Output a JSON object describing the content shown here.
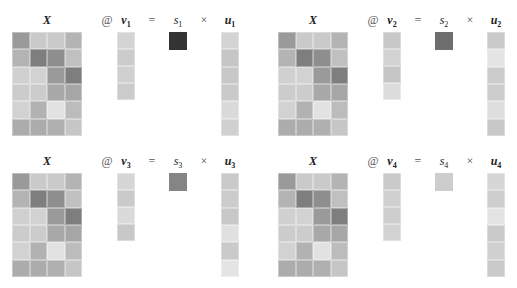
{
  "matrix_label": "X",
  "operators": {
    "matmul": "@",
    "equals": "=",
    "times": "×"
  },
  "x_matrix_colors": [
    [
      "#9a9a9a",
      "#cacaca",
      "#cacaca",
      "#b4b4b4"
    ],
    [
      "#b4b4b4",
      "#7e7e7e",
      "#8e8e8e",
      "#c0c0c0"
    ],
    [
      "#d0d0d0",
      "#d2d2d2",
      "#9a9a9a",
      "#7e7e7e"
    ],
    [
      "#cccccc",
      "#cccccc",
      "#a8a8a8",
      "#a6a6a6"
    ],
    [
      "#d2d2d2",
      "#b2b2b2",
      "#e2e2e2",
      "#bcbcbc"
    ],
    [
      "#acacac",
      "#acacac",
      "#b0b0b0",
      "#c6c6c6"
    ]
  ],
  "panels": [
    {
      "index": "1",
      "v_label": "v",
      "s_label": "s",
      "u_label": "u",
      "v_colors": [
        "#d4d4d4",
        "#cccccc",
        "#d0d0d0",
        "#cbcbcb"
      ],
      "s_color": "#333333",
      "u_colors": [
        "#d4d4d4",
        "#c6c6c6",
        "#c8c8c8",
        "#cacaca",
        "#dadada",
        "#d0d0d0"
      ]
    },
    {
      "index": "2",
      "v_label": "v",
      "s_label": "s",
      "u_label": "u",
      "v_colors": [
        "#c8c8c8",
        "#d2d2d2",
        "#c6c6c6",
        "#dcdcdc"
      ],
      "s_color": "#6e6e6e",
      "u_colors": [
        "#cacaca",
        "#e4e4e4",
        "#cccccc",
        "#cdcdcd",
        "#dedede",
        "#c8c8c8"
      ]
    },
    {
      "index": "3",
      "v_label": "v",
      "s_label": "s",
      "u_label": "u",
      "v_colors": [
        "#d6d6d6",
        "#cacaca",
        "#dadada",
        "#c8c8c8"
      ],
      "s_color": "#858585",
      "u_colors": [
        "#cacaca",
        "#cccccc",
        "#c8c8c8",
        "#e0e0e0",
        "#cacaca",
        "#e4e4e4"
      ]
    },
    {
      "index": "4",
      "v_label": "v",
      "s_label": "s",
      "u_label": "u",
      "v_colors": [
        "#cacaca",
        "#d0d0d0",
        "#cecece",
        "#d2d2d2"
      ],
      "s_color": "#cdcdcd",
      "u_colors": [
        "#d6d6d6",
        "#cecece",
        "#e4e4e4",
        "#cacaca",
        "#d0d0d0",
        "#cacaca"
      ]
    }
  ]
}
